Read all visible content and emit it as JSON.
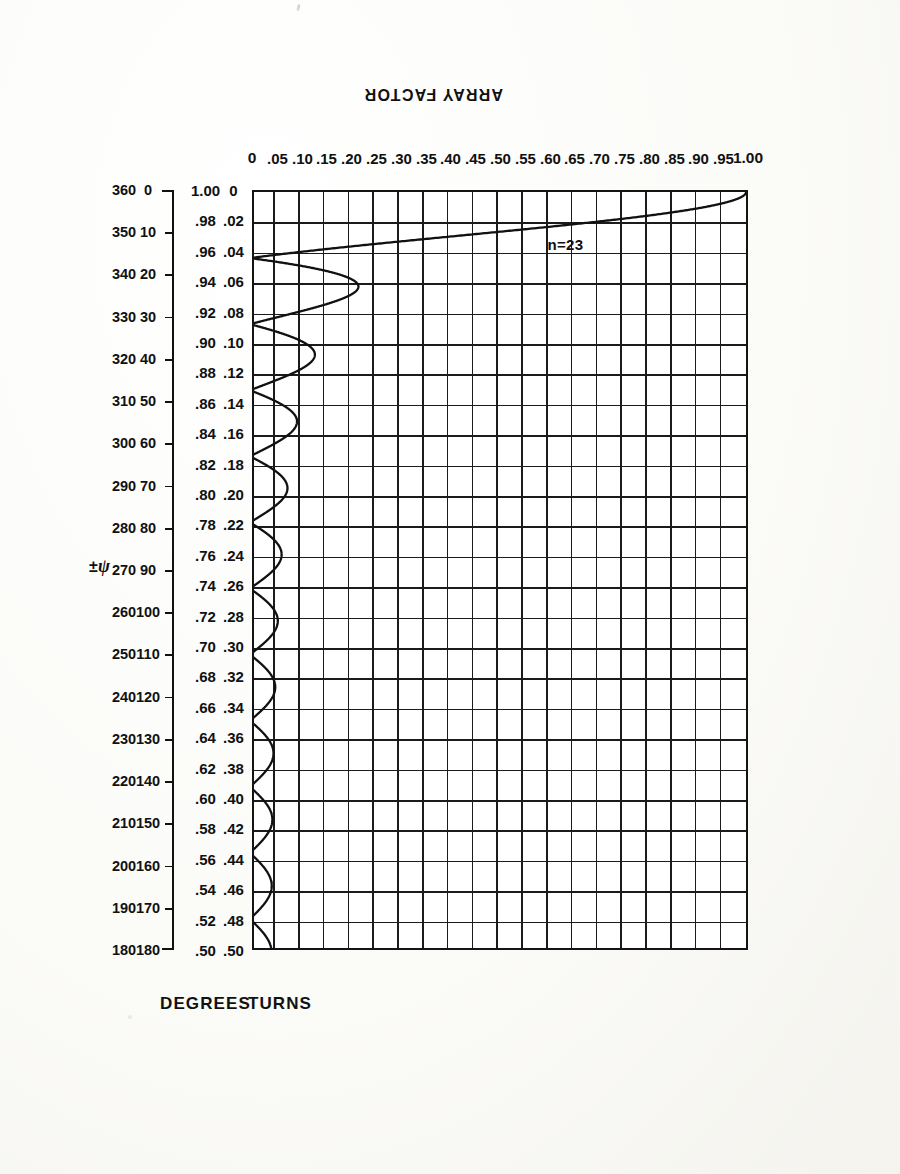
{
  "chart_data": {
    "type": "line",
    "title": "",
    "annotation": "n=23",
    "ylabel": "ARRAY FACTOR",
    "ylim": [
      0,
      1.0
    ],
    "yticks": [
      "0",
      ".05",
      ".10",
      ".15",
      ".20",
      ".25",
      ".30",
      ".35",
      ".40",
      ".45",
      ".50",
      ".55",
      ".60",
      ".65",
      ".70",
      ".75",
      ".80",
      ".85",
      ".90",
      ".95",
      "1.00"
    ],
    "ytick_values": [
      0,
      0.05,
      0.1,
      0.15,
      0.2,
      0.25,
      0.3,
      0.35,
      0.4,
      0.45,
      0.5,
      0.55,
      0.6,
      0.65,
      0.7,
      0.75,
      0.8,
      0.85,
      0.9,
      0.95,
      1.0
    ],
    "xlabel_primary": "TURNS",
    "xlabel_secondary": "DEGREES",
    "xaxis_symbol": "±ψ",
    "xlim_turns": [
      0,
      0.5
    ],
    "xticks_turns_upper": [
      "0",
      ".02",
      ".04",
      ".06",
      ".08",
      ".10",
      ".12",
      ".14",
      ".16",
      ".18",
      ".20",
      ".22",
      ".24",
      ".26",
      ".28",
      ".30",
      ".32",
      ".34",
      ".36",
      ".38",
      ".40",
      ".42",
      ".44",
      ".46",
      ".48",
      ".50"
    ],
    "xticks_turns_lower": [
      "1.00",
      ".98",
      ".96",
      ".94",
      ".92",
      ".90",
      ".88",
      ".86",
      ".84",
      ".82",
      ".80",
      ".78",
      ".76",
      ".74",
      ".72",
      ".70",
      ".68",
      ".66",
      ".64",
      ".62",
      ".60",
      ".58",
      ".56",
      ".54",
      ".52",
      ".50"
    ],
    "xticks_turns_values": [
      0,
      0.02,
      0.04,
      0.06,
      0.08,
      0.1,
      0.12,
      0.14,
      0.16,
      0.18,
      0.2,
      0.22,
      0.24,
      0.26,
      0.28,
      0.3,
      0.32,
      0.34,
      0.36,
      0.38,
      0.4,
      0.42,
      0.44,
      0.46,
      0.48,
      0.5
    ],
    "xticks_degrees_upper": [
      "0",
      "10",
      "20",
      "30",
      "40",
      "50",
      "60",
      "70",
      "80",
      "90",
      "100",
      "110",
      "120",
      "130",
      "140",
      "150",
      "160",
      "170",
      "180"
    ],
    "xticks_degrees_lower": [
      "360",
      "350",
      "340",
      "330",
      "320",
      "310",
      "300",
      "290",
      "280",
      "270",
      "260",
      "250",
      "240",
      "230",
      "220",
      "210",
      "200",
      "190",
      "180"
    ],
    "xticks_degrees_values": [
      0,
      10,
      20,
      30,
      40,
      50,
      60,
      70,
      80,
      90,
      100,
      110,
      120,
      130,
      140,
      150,
      160,
      170,
      180
    ],
    "grid": true,
    "legend": "none",
    "n_elements": 23,
    "formula": "AF = |sin(n*psi/2) / (n*sin(psi/2))|",
    "series": [
      {
        "name": "array factor n=23",
        "null_positions_turns": [
          0.0435,
          0.087,
          0.1304,
          0.1739,
          0.2174,
          0.2609,
          0.3043,
          0.3478,
          0.3913,
          0.4348,
          0.4783
        ],
        "sidelobe_peaks_turns": [
          0.0652,
          0.1087,
          0.1522,
          0.1957,
          0.2391,
          0.2826,
          0.3261,
          0.3696,
          0.413,
          0.4565,
          0.5
        ],
        "sidelobe_peaks_values": [
          0.217,
          0.128,
          0.091,
          0.071,
          0.059,
          0.051,
          0.046,
          0.043,
          0.041,
          0.04,
          0.04
        ],
        "main_lobe_peak": {
          "x_turns": 0.0,
          "y": 1.0
        },
        "half_power_turns": 0.0192
      }
    ],
    "line_color": "#111111"
  },
  "figure": {
    "y_axis_title": "ARRAY FACTOR",
    "x_axis_title_turns": "TURNS",
    "x_axis_title_degrees": "DEGREES",
    "psi_label": "±ψ",
    "curve_annotation": "n=23"
  }
}
